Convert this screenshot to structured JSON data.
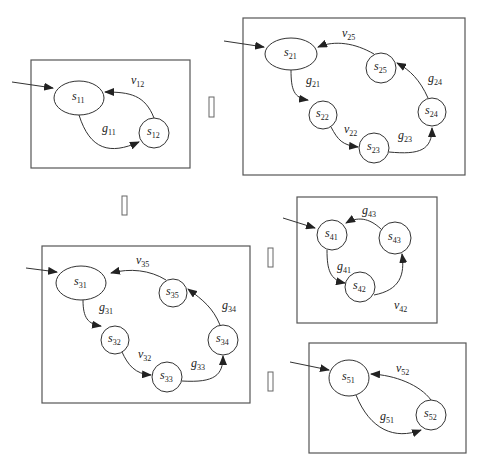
{
  "diagram": {
    "type": "state-machine-set",
    "machines": [
      {
        "id": "m1",
        "states": [
          {
            "id": "s11",
            "label": "s",
            "sub": "11",
            "initial": true
          },
          {
            "id": "s12",
            "label": "s",
            "sub": "12"
          }
        ],
        "transitions": [
          {
            "from": "s11",
            "to": "s12",
            "label": "g",
            "sub": "11"
          },
          {
            "from": "s12",
            "to": "s11",
            "label": "v",
            "sub": "12"
          }
        ]
      },
      {
        "id": "m2",
        "states": [
          {
            "id": "s21",
            "label": "s",
            "sub": "21",
            "initial": true
          },
          {
            "id": "s22",
            "label": "s",
            "sub": "22"
          },
          {
            "id": "s23",
            "label": "s",
            "sub": "23"
          },
          {
            "id": "s24",
            "label": "s",
            "sub": "24"
          },
          {
            "id": "s25",
            "label": "s",
            "sub": "25"
          }
        ],
        "transitions": [
          {
            "from": "s21",
            "to": "s22",
            "label": "g",
            "sub": "21"
          },
          {
            "from": "s22",
            "to": "s23",
            "label": "v",
            "sub": "22"
          },
          {
            "from": "s23",
            "to": "s24",
            "label": "g",
            "sub": "23"
          },
          {
            "from": "s24",
            "to": "s25",
            "label": "g",
            "sub": "24"
          },
          {
            "from": "s25",
            "to": "s21",
            "label": "v",
            "sub": "25"
          }
        ]
      },
      {
        "id": "m3",
        "states": [
          {
            "id": "s31",
            "label": "s",
            "sub": "31",
            "initial": true
          },
          {
            "id": "s32",
            "label": "s",
            "sub": "32"
          },
          {
            "id": "s33",
            "label": "s",
            "sub": "33"
          },
          {
            "id": "s34",
            "label": "s",
            "sub": "34"
          },
          {
            "id": "s35",
            "label": "s",
            "sub": "35"
          }
        ],
        "transitions": [
          {
            "from": "s31",
            "to": "s32",
            "label": "g",
            "sub": "31"
          },
          {
            "from": "s32",
            "to": "s33",
            "label": "v",
            "sub": "32"
          },
          {
            "from": "s33",
            "to": "s34",
            "label": "g",
            "sub": "33"
          },
          {
            "from": "s34",
            "to": "s35",
            "label": "g",
            "sub": "34"
          },
          {
            "from": "s35",
            "to": "s31",
            "label": "v",
            "sub": "35"
          }
        ]
      },
      {
        "id": "m4",
        "states": [
          {
            "id": "s41",
            "label": "s",
            "sub": "41",
            "initial": true
          },
          {
            "id": "s42",
            "label": "s",
            "sub": "42"
          },
          {
            "id": "s43",
            "label": "s",
            "sub": "43"
          }
        ],
        "transitions": [
          {
            "from": "s41",
            "to": "s42",
            "label": "g",
            "sub": "41"
          },
          {
            "from": "s42",
            "to": "s43",
            "label": "v",
            "sub": "42"
          },
          {
            "from": "s43",
            "to": "s41",
            "label": "g",
            "sub": "43"
          }
        ]
      },
      {
        "id": "m5",
        "states": [
          {
            "id": "s51",
            "label": "s",
            "sub": "51",
            "initial": true
          },
          {
            "id": "s52",
            "label": "s",
            "sub": "52"
          }
        ],
        "transitions": [
          {
            "from": "s51",
            "to": "s52",
            "label": "g",
            "sub": "51"
          },
          {
            "from": "s52",
            "to": "s51",
            "label": "v",
            "sub": "52"
          }
        ]
      }
    ],
    "separators": 4
  }
}
